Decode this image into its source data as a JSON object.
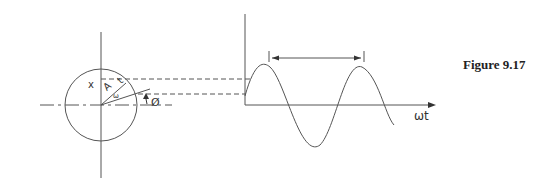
{
  "figure": {
    "caption": "Figure 9.17",
    "phasor": {
      "labels": {
        "x": "x",
        "amplitude": "A",
        "time": "t",
        "omega": "ω",
        "phase": "Ø"
      }
    },
    "waveform": {
      "axis_label": "ωt"
    }
  }
}
